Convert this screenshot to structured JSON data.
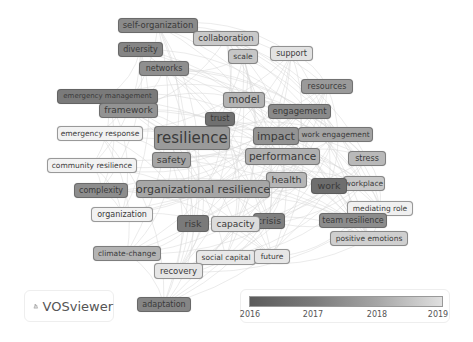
{
  "app": {
    "brand": "VOSviewer",
    "brand_icon": "vosviewer-logo-icon"
  },
  "legend": {
    "ticks": [
      "2016",
      "2017",
      "2018",
      "2019"
    ],
    "color_start": "#5b5b5b",
    "color_end": "#e0e0e0"
  },
  "nodes": [
    {
      "label": "self-organization",
      "x": 118,
      "y": 18,
      "w": 80,
      "h": 15,
      "fs": 8.5,
      "shade": "#8a8a8a"
    },
    {
      "label": "collaboration",
      "x": 193,
      "y": 31,
      "w": 66,
      "h": 15,
      "fs": 8.5,
      "shade": "#c9c9c9"
    },
    {
      "label": "diversity",
      "x": 118,
      "y": 42,
      "w": 45,
      "h": 15,
      "fs": 8,
      "shade": "#858585"
    },
    {
      "label": "scale",
      "x": 228,
      "y": 49,
      "w": 30,
      "h": 15,
      "fs": 7.5,
      "shade": "#c6c6c6"
    },
    {
      "label": "support",
      "x": 270,
      "y": 46,
      "w": 43,
      "h": 15,
      "fs": 8,
      "shade": "#e2e2e2"
    },
    {
      "label": "networks",
      "x": 139,
      "y": 61,
      "w": 50,
      "h": 15,
      "fs": 8,
      "shade": "#8f8f8f"
    },
    {
      "label": "emergency management",
      "x": 57,
      "y": 89,
      "w": 101,
      "h": 15,
      "fs": 7,
      "shade": "#7a7a7a"
    },
    {
      "label": "framework",
      "x": 99,
      "y": 103,
      "w": 59,
      "h": 15,
      "fs": 9,
      "shade": "#939393"
    },
    {
      "label": "resources",
      "x": 301,
      "y": 79,
      "w": 52,
      "h": 15,
      "fs": 8,
      "shade": "#9a9a9a"
    },
    {
      "label": "model",
      "x": 223,
      "y": 92,
      "w": 42,
      "h": 16,
      "fs": 10,
      "shade": "#b3b3b3"
    },
    {
      "label": "engagement",
      "x": 268,
      "y": 104,
      "w": 63,
      "h": 15,
      "fs": 8.5,
      "shade": "#8a8a8a"
    },
    {
      "label": "trust",
      "x": 205,
      "y": 112,
      "w": 30,
      "h": 14,
      "fs": 8,
      "shade": "#707070"
    },
    {
      "label": "emergency response",
      "x": 57,
      "y": 126,
      "w": 86,
      "h": 15,
      "fs": 7.5,
      "shade": "#f2f2f2"
    },
    {
      "label": "resilience",
      "x": 154,
      "y": 126,
      "w": 76,
      "h": 24,
      "fs": 15,
      "shade": "#9a9a9a"
    },
    {
      "label": "impact",
      "x": 253,
      "y": 127,
      "w": 46,
      "h": 18,
      "fs": 11,
      "shade": "#939393"
    },
    {
      "label": "work engagement",
      "x": 298,
      "y": 127,
      "w": 75,
      "h": 15,
      "fs": 7.5,
      "shade": "#a3a3a3"
    },
    {
      "label": "safety",
      "x": 152,
      "y": 152,
      "w": 39,
      "h": 16,
      "fs": 9.5,
      "shade": "#a5a5a5"
    },
    {
      "label": "performance",
      "x": 245,
      "y": 148,
      "w": 75,
      "h": 17,
      "fs": 10.5,
      "shade": "#b0b0b0"
    },
    {
      "label": "community resilience",
      "x": 47,
      "y": 158,
      "w": 90,
      "h": 15,
      "fs": 7.5,
      "shade": "#f2f2f2"
    },
    {
      "label": "stress",
      "x": 348,
      "y": 151,
      "w": 38,
      "h": 15,
      "fs": 8,
      "shade": "#b9b9b9"
    },
    {
      "label": "health",
      "x": 266,
      "y": 172,
      "w": 41,
      "h": 16,
      "fs": 9.5,
      "shade": "#b6b6b6"
    },
    {
      "label": "organizational resilience",
      "x": 136,
      "y": 180,
      "w": 134,
      "h": 18,
      "fs": 11,
      "shade": "#a6a6a6"
    },
    {
      "label": "complexity",
      "x": 74,
      "y": 183,
      "w": 54,
      "h": 15,
      "fs": 8,
      "shade": "#8d8d8d"
    },
    {
      "label": "workplace",
      "x": 343,
      "y": 176,
      "w": 42,
      "h": 15,
      "fs": 7.5,
      "shade": "#c8c8c8"
    },
    {
      "label": "work",
      "x": 311,
      "y": 178,
      "w": 36,
      "h": 16,
      "fs": 9.5,
      "shade": "#6e6e6e"
    },
    {
      "label": "mediating role",
      "x": 347,
      "y": 201,
      "w": 66,
      "h": 15,
      "fs": 7.5,
      "shade": "#f0f0f0"
    },
    {
      "label": "organization",
      "x": 91,
      "y": 207,
      "w": 62,
      "h": 15,
      "fs": 8,
      "shade": "#f2f2f2"
    },
    {
      "label": "crisis",
      "x": 253,
      "y": 213,
      "w": 32,
      "h": 16,
      "fs": 9.5,
      "shade": "#7f7f7f"
    },
    {
      "label": "risk",
      "x": 177,
      "y": 215,
      "w": 32,
      "h": 17,
      "fs": 9.5,
      "shade": "#7a7a7a"
    },
    {
      "label": "capacity",
      "x": 211,
      "y": 216,
      "w": 49,
      "h": 16,
      "fs": 9,
      "shade": "#dcdcdc"
    },
    {
      "label": "team resilience",
      "x": 319,
      "y": 213,
      "w": 68,
      "h": 15,
      "fs": 8,
      "shade": "#8c8c8c"
    },
    {
      "label": "positive emotions",
      "x": 330,
      "y": 231,
      "w": 78,
      "h": 15,
      "fs": 7.5,
      "shade": "#cfcfcf"
    },
    {
      "label": "climate-change",
      "x": 93,
      "y": 246,
      "w": 68,
      "h": 15,
      "fs": 7.5,
      "shade": "#b3b3b3"
    },
    {
      "label": "social capital",
      "x": 196,
      "y": 250,
      "w": 60,
      "h": 15,
      "fs": 7.5,
      "shade": "#e8e8e8"
    },
    {
      "label": "future",
      "x": 254,
      "y": 249,
      "w": 36,
      "h": 15,
      "fs": 7.5,
      "shade": "#e6e6e6"
    },
    {
      "label": "recovery",
      "x": 154,
      "y": 263,
      "w": 49,
      "h": 16,
      "fs": 8.5,
      "shade": "#e6e6e6"
    },
    {
      "label": "adaptation",
      "x": 137,
      "y": 297,
      "w": 54,
      "h": 15,
      "fs": 8,
      "shade": "#858585"
    }
  ]
}
